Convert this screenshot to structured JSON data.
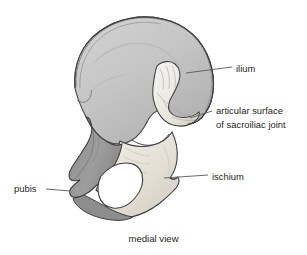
{
  "figure": {
    "caption": "medial view",
    "background_color": "#ffffff",
    "text_color": "#231f20",
    "leader_line_color": "#58595b"
  },
  "labels": [
    {
      "id": "ilium",
      "text": "ilium",
      "lines": [
        "ilium"
      ],
      "leader": {
        "x1": 186,
        "y1": 73,
        "x2": 232,
        "y2": 67
      }
    },
    {
      "id": "sacroiliac",
      "text": "articular surface of sacroiliac joint",
      "lines": [
        "articular surface",
        "of sacroiliac joint"
      ],
      "leader": {
        "x1": 190,
        "y1": 118,
        "x2": 212,
        "y2": 111
      }
    },
    {
      "id": "ischium",
      "text": "ischium",
      "lines": [
        "ischium"
      ],
      "leader": {
        "x1": 164,
        "y1": 178,
        "x2": 208,
        "y2": 175
      }
    },
    {
      "id": "pubis",
      "text": "pubis",
      "lines": [
        "pubis"
      ],
      "leader": {
        "x1": 46,
        "y1": 189,
        "x2": 70,
        "y2": 191
      }
    }
  ],
  "label_text": {
    "ilium": "ilium",
    "sacroiliac_line1": "articular surface",
    "sacroiliac_line2": "of sacroiliac joint",
    "ischium": "ischium",
    "pubis": "pubis"
  },
  "regions": [
    {
      "name": "ilium",
      "description": "large fan-shaped wing of the hip bone, upper portion",
      "fill": "#c9c9c9"
    },
    {
      "name": "auricular-surface",
      "description": "ear-shaped articular surface of the sacroiliac joint",
      "fill": "#f6f5f2"
    },
    {
      "name": "pubis",
      "description": "anterior-inferior portion, shaded darker gray",
      "fill": "#9a9a9a"
    },
    {
      "name": "ischium",
      "description": "posterior-inferior portion, pale cream tone",
      "fill": "#efece5"
    },
    {
      "name": "obturator-foramen",
      "description": "large opening bounded by pubis and ischium",
      "fill": "#ffffff"
    }
  ],
  "colors": {
    "ilium_fill": "#c9c9c9",
    "ilium_shadow": "#a8a8a8",
    "pubis_fill": "#9a9a9a",
    "ischium_fill": "#efece5",
    "auricular_fill": "#f7f6f3",
    "outline": "#3c3c3c",
    "foramen": "#ffffff"
  }
}
